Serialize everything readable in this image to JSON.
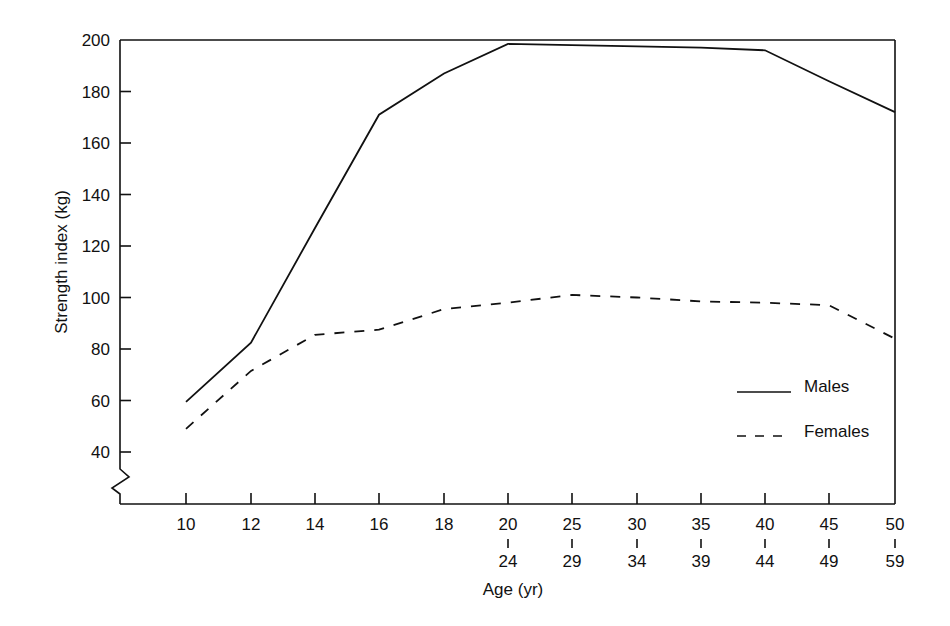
{
  "chart_data": {
    "type": "line",
    "title": "",
    "xlabel": "Age (yr)",
    "ylabel": "Strength index (kg)",
    "categories": [
      "10",
      "12",
      "14",
      "16",
      "18",
      "20-24",
      "25-29",
      "30-34",
      "35-39",
      "40-44",
      "45-49",
      "50-59"
    ],
    "x_tick_labels": [
      {
        "top": "10",
        "bottom": ""
      },
      {
        "top": "12",
        "bottom": ""
      },
      {
        "top": "14",
        "bottom": ""
      },
      {
        "top": "16",
        "bottom": ""
      },
      {
        "top": "18",
        "bottom": ""
      },
      {
        "top": "20",
        "bottom": "24"
      },
      {
        "top": "25",
        "bottom": "29"
      },
      {
        "top": "30",
        "bottom": "34"
      },
      {
        "top": "35",
        "bottom": "39"
      },
      {
        "top": "40",
        "bottom": "44"
      },
      {
        "top": "45",
        "bottom": "49"
      },
      {
        "top": "50",
        "bottom": "59"
      }
    ],
    "y_ticks": [
      40,
      60,
      80,
      100,
      120,
      140,
      160,
      180,
      200
    ],
    "ylim": [
      30,
      200
    ],
    "y_axis_break": true,
    "grid": false,
    "legend_position": "lower-right-inside",
    "series": [
      {
        "name": "Males",
        "style": "solid",
        "values": [
          59.5,
          82.5,
          127,
          171,
          187,
          198.5,
          198,
          197.5,
          197,
          196,
          184,
          172
        ]
      },
      {
        "name": "Females",
        "style": "dashed",
        "values": [
          49,
          71.5,
          85.5,
          87.5,
          95.5,
          98,
          101,
          100,
          98.5,
          98,
          97,
          84
        ]
      }
    ]
  },
  "colors": {
    "line": "#111111",
    "background": "#ffffff"
  }
}
